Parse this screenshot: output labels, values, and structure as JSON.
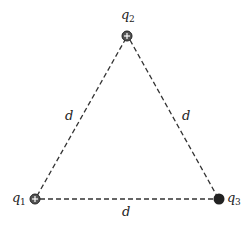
{
  "diagram": {
    "title": "",
    "charges": [
      {
        "name": "q",
        "sub": "2",
        "sign": "positive",
        "symbol": "plus-circle"
      },
      {
        "name": "q",
        "sub": "1",
        "sign": "positive",
        "symbol": "plus-circle"
      },
      {
        "name": "q",
        "sub": "3",
        "sign": "negative",
        "symbol": "filled-circle"
      }
    ],
    "sides": [
      {
        "label": "d",
        "between": "q1-q2"
      },
      {
        "label": "d",
        "between": "q2-q3"
      },
      {
        "label": "d",
        "between": "q1-q3"
      }
    ],
    "colors": {
      "ink": "#222222",
      "background": "#ffffff"
    }
  }
}
